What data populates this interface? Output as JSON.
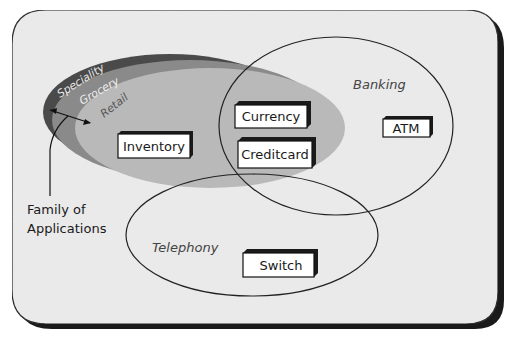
{
  "diagram": {
    "family_rings": [
      {
        "label": "Speciality",
        "color": "#4a4a4a",
        "text_color": "#e8e8e8"
      },
      {
        "label": "Grocery",
        "color": "#8a8a8a",
        "text_color": "#eeeeee"
      },
      {
        "label": "Retail",
        "color": "#b9b9b9",
        "text_color": "#555555"
      }
    ],
    "regions": {
      "banking": "Banking",
      "telephony": "Telephony"
    },
    "components": {
      "inventory": "Inventory",
      "currency": "Currency",
      "creditcard": "Creditcard",
      "atm": "ATM",
      "switch": "Switch"
    },
    "callout": {
      "line1": "Family of",
      "line2": "Applications"
    },
    "colors": {
      "frame_fill": "#ececec",
      "frame_border": "#1a1a1a",
      "box_fill": "#ffffff",
      "box_shadow": "#1a1a1a"
    }
  }
}
